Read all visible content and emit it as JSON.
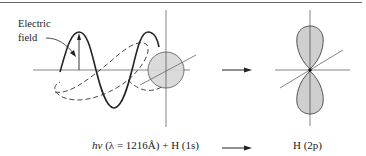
{
  "diagram": {
    "annotation": {
      "line1": "Electric",
      "line2": "field"
    },
    "left_caption": {
      "hv": "hν",
      "rest": " (λ = 1216Å) + H (1s)"
    },
    "right_caption": "H (2p)",
    "colors": {
      "line": "#222222",
      "fill": "#cfcfcf",
      "axis": "#555555"
    }
  }
}
